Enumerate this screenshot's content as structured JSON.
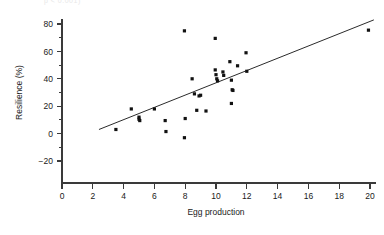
{
  "figure": {
    "caption_fragment": "p < 0.001)",
    "background_color": "#ffffff",
    "point_color": "#111111",
    "line_color": "#2b2b2b",
    "axis_color": "#3a3a3a"
  },
  "chart_data": {
    "type": "scatter",
    "title": "",
    "xlabel": "Egg production",
    "ylabel": "Resilience (%)",
    "xlim": [
      0,
      20.6
    ],
    "ylim": [
      -28,
      84
    ],
    "grid": false,
    "legend": null,
    "x_ticks": [
      0,
      2,
      4,
      6,
      8,
      10,
      12,
      14,
      16,
      18,
      20
    ],
    "x_tick_labels": [
      "0",
      "2",
      "4",
      "6",
      "8",
      "10",
      "12",
      "14",
      "16",
      "18",
      "20"
    ],
    "x_minor_ticks": [
      1,
      3,
      5,
      7,
      9,
      11,
      13,
      15,
      17,
      19
    ],
    "y_ticks": [
      -20,
      0,
      20,
      40,
      60,
      80
    ],
    "y_tick_labels": [
      "−20",
      "0",
      "20",
      "40",
      "60",
      "80"
    ],
    "y_minor_ticks": [
      -10,
      10,
      30,
      50,
      70
    ],
    "points": [
      [
        3.5,
        3
      ],
      [
        4.5,
        18
      ],
      [
        5.0,
        12
      ],
      [
        5.0,
        10.5
      ],
      [
        5.05,
        9.5
      ],
      [
        6.0,
        18
      ],
      [
        6.7,
        9.5
      ],
      [
        6.75,
        1.5
      ],
      [
        7.95,
        75
      ],
      [
        7.95,
        -3
      ],
      [
        8.0,
        11
      ],
      [
        8.45,
        40
      ],
      [
        8.6,
        29
      ],
      [
        8.75,
        17
      ],
      [
        8.9,
        27.5
      ],
      [
        9.0,
        28
      ],
      [
        9.35,
        16.5
      ],
      [
        9.95,
        69.5
      ],
      [
        9.95,
        46.5
      ],
      [
        10.0,
        43
      ],
      [
        10.05,
        40
      ],
      [
        10.1,
        38.5
      ],
      [
        10.45,
        45
      ],
      [
        10.5,
        42.5
      ],
      [
        10.9,
        52.5
      ],
      [
        11.0,
        39
      ],
      [
        11.05,
        32
      ],
      [
        11.1,
        31.5
      ],
      [
        11.0,
        22
      ],
      [
        11.4,
        49.5
      ],
      [
        11.95,
        59
      ],
      [
        12.0,
        45.5
      ],
      [
        19.9,
        75.5
      ]
    ],
    "fit_line": {
      "type": "linear",
      "x_start": 2.4,
      "y_start": 3.0,
      "x_end": 20.25,
      "y_end": 83.0
    }
  }
}
